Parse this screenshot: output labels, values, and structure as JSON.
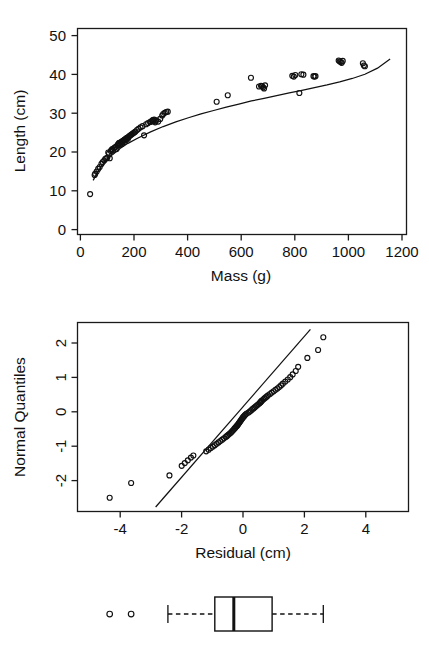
{
  "figure": {
    "title": "",
    "panels": [
      "scatter-with-fit",
      "normal-qq",
      "boxplot"
    ]
  },
  "chart_data": [
    {
      "type": "scatter",
      "id": "mass-length-scatter",
      "title": "",
      "xlabel": "Mass (g)",
      "ylabel": "Length (cm)",
      "xlim": [
        -40,
        1265
      ],
      "ylim": [
        -2.0,
        52.0
      ],
      "xticks": [
        0,
        200,
        400,
        600,
        800,
        1000,
        1200
      ],
      "xtick_labels": [
        "0",
        "200",
        "400",
        "600",
        "800",
        "1000",
        "1200"
      ],
      "yticks": [
        0,
        10,
        20,
        30,
        40,
        50
      ],
      "ytick_labels": [
        "0",
        "10",
        "20",
        "30",
        "40",
        "50"
      ],
      "grid": false,
      "legend": null,
      "marker": "open-circle",
      "x": [
        10,
        28,
        30,
        36,
        42,
        48,
        55,
        60,
        66,
        70,
        74,
        78,
        82,
        85,
        88,
        92,
        95,
        98,
        100,
        104,
        108,
        112,
        115,
        118,
        120,
        124,
        126,
        128,
        130,
        132,
        134,
        136,
        138,
        140,
        142,
        144,
        146,
        148,
        150,
        152,
        154,
        156,
        158,
        160,
        163,
        166,
        170,
        174,
        178,
        182,
        186,
        190,
        196,
        202,
        210,
        218,
        224,
        232,
        240,
        248,
        252,
        256,
        258,
        260,
        262,
        264,
        268,
        272,
        280,
        288,
        296,
        300,
        306,
        312,
        318,
        512,
        556,
        648,
        680,
        688,
        692,
        696,
        700,
        704,
        812,
        818,
        824,
        840,
        848,
        856,
        896,
        900,
        904,
        996,
        1000,
        1004,
        1008,
        1012,
        1092,
        1096,
        1100
      ],
      "y": [
        8.6,
        13.6,
        13.9,
        14.5,
        15.2,
        15.7,
        16.5,
        17.0,
        17.4,
        17.8,
        18.0,
        18.1,
        19.5,
        19.2,
        18.0,
        19.9,
        20.1,
        20.4,
        20.0,
        20.6,
        20.8,
        21.0,
        20.4,
        21.3,
        21.6,
        21.9,
        22.0,
        21.5,
        21.8,
        22.1,
        22.3,
        21.7,
        22.4,
        22.5,
        22.6,
        22.2,
        22.8,
        22.9,
        23.0,
        22.7,
        23.2,
        23.3,
        23.4,
        23.1,
        23.6,
        23.8,
        24.0,
        24.2,
        24.4,
        24.6,
        24.8,
        25.0,
        25.4,
        25.7,
        26.1,
        26.4,
        24.0,
        26.9,
        27.2,
        27.5,
        27.6,
        27.8,
        27.9,
        28.0,
        27.7,
        28.1,
        27.4,
        27.9,
        27.6,
        28.3,
        29.2,
        29.6,
        29.9,
        30.1,
        30.2,
        32.8,
        34.5,
        39.1,
        36.8,
        37.0,
        36.9,
        36.6,
        36.3,
        37.1,
        39.6,
        39.4,
        39.8,
        35.1,
        40.0,
        39.9,
        39.5,
        39.4,
        39.5,
        43.6,
        43.4,
        43.2,
        43.0,
        43.5,
        42.9,
        42.3,
        42.1
      ],
      "fit_curve": {
        "label": "fitted power/log curve",
        "x": [
          22,
          40,
          60,
          80,
          100,
          130,
          160,
          200,
          250,
          300,
          350,
          400,
          450,
          500,
          550,
          600,
          650,
          700,
          750,
          800,
          850,
          900,
          950,
          1000,
          1050,
          1100,
          1150,
          1200
        ],
        "y": [
          12.2,
          14.4,
          16.3,
          17.8,
          19.0,
          20.6,
          21.9,
          23.3,
          24.9,
          26.3,
          27.5,
          28.6,
          29.6,
          30.5,
          31.4,
          32.2,
          33.0,
          33.7,
          34.4,
          35.1,
          35.8,
          36.5,
          37.2,
          38.0,
          38.9,
          40.0,
          41.6,
          44.0
        ]
      }
    },
    {
      "type": "scatter",
      "id": "normal-qq-plot",
      "title": "",
      "xlabel": "Residual (cm)",
      "ylabel": "Normal Quantiles",
      "xlim": [
        -5.4,
        5.4
      ],
      "ylim": [
        -2.75,
        2.75
      ],
      "xticks": [
        -4,
        -2,
        0,
        2,
        4
      ],
      "xtick_labels": [
        "-4",
        "-2",
        "0",
        "2",
        "4"
      ],
      "yticks": [
        -2,
        -1,
        0,
        1,
        2
      ],
      "ytick_labels": [
        "-2",
        "-1",
        "0",
        "1",
        "2"
      ],
      "grid": false,
      "legend": null,
      "marker": "open-circle",
      "x": [
        -4.35,
        -3.65,
        -2.4,
        -2.0,
        -1.9,
        -1.8,
        -1.7,
        -1.62,
        -1.2,
        -1.12,
        -1.05,
        -0.98,
        -0.92,
        -0.86,
        -0.8,
        -0.74,
        -0.68,
        -0.62,
        -0.56,
        -0.52,
        -0.48,
        -0.44,
        -0.4,
        -0.37,
        -0.34,
        -0.31,
        -0.28,
        -0.25,
        -0.22,
        -0.2,
        -0.18,
        -0.16,
        -0.14,
        -0.12,
        -0.1,
        -0.08,
        -0.06,
        -0.04,
        -0.02,
        0.0,
        0.02,
        0.05,
        0.08,
        0.12,
        0.18,
        0.22,
        0.26,
        0.3,
        0.34,
        0.38,
        0.42,
        0.46,
        0.5,
        0.54,
        0.56,
        0.58,
        0.6,
        0.62,
        0.66,
        0.7,
        0.74,
        0.78,
        0.82,
        0.88,
        0.94,
        1.0,
        1.06,
        1.12,
        1.18,
        1.24,
        1.3,
        1.38,
        1.46,
        1.54,
        1.62,
        1.72,
        1.8,
        2.1,
        2.45,
        2.62
      ],
      "y": [
        -2.35,
        -1.92,
        -1.7,
        -1.42,
        -1.34,
        -1.26,
        -1.18,
        -1.12,
        -1.0,
        -0.95,
        -0.9,
        -0.86,
        -0.82,
        -0.78,
        -0.74,
        -0.7,
        -0.66,
        -0.62,
        -0.58,
        -0.55,
        -0.52,
        -0.49,
        -0.46,
        -0.43,
        -0.4,
        -0.37,
        -0.34,
        -0.31,
        -0.28,
        -0.26,
        -0.24,
        -0.21,
        -0.19,
        -0.16,
        -0.14,
        -0.11,
        -0.09,
        -0.06,
        -0.04,
        -0.01,
        0.01,
        0.04,
        0.07,
        0.1,
        0.13,
        0.16,
        0.19,
        0.22,
        0.25,
        0.28,
        0.31,
        0.34,
        0.37,
        0.4,
        0.42,
        0.44,
        0.46,
        0.48,
        0.51,
        0.54,
        0.57,
        0.6,
        0.63,
        0.67,
        0.71,
        0.75,
        0.79,
        0.83,
        0.87,
        0.92,
        0.97,
        1.03,
        1.09,
        1.16,
        1.24,
        1.34,
        1.46,
        1.72,
        1.95,
        2.32
      ],
      "reference_line": {
        "label": "normal reference line",
        "x1": -2.85,
        "y1": -2.62,
        "x2": 2.2,
        "y2": 2.55
      }
    },
    {
      "type": "boxplot",
      "id": "residual-boxplot",
      "title": "",
      "xlabel": "",
      "ylabel": "",
      "orientation": "horizontal",
      "axis_visible": false,
      "stats": {
        "whisker_low": -2.45,
        "q1": -0.92,
        "median": -0.3,
        "q3": 0.95,
        "whisker_high": 2.62
      },
      "outliers": [
        -4.35,
        -3.65
      ],
      "outlier_marker": "open-circle"
    }
  ]
}
